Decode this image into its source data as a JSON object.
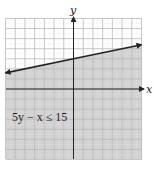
{
  "chart_data": {
    "type": "line",
    "title": "",
    "xlabel": "x",
    "ylabel": "y",
    "xlim": [
      -7,
      7
    ],
    "ylim": [
      -7,
      7
    ],
    "grid": true,
    "grid_step": 1,
    "boundary": {
      "equation": "5y - x = 15",
      "slope": 0.2,
      "intercept": 3,
      "style": "solid",
      "arrows": "both",
      "points": [
        [
          -7,
          1.6
        ],
        [
          7,
          4.4
        ]
      ]
    },
    "shaded_region": "below",
    "annotations": [
      {
        "text": "5y − x ≤ 15",
        "x": -6.4,
        "y": -3.2
      }
    ],
    "colors": {
      "shade": "#d3d3d3",
      "grid_major_unshaded": "#cfcfcf",
      "grid_major_shaded": "#ababab",
      "axis": "#222222",
      "line": "#222222"
    }
  },
  "labels": {
    "x_axis": "x",
    "y_axis": "y",
    "inequality": "5y − x ≤ 15"
  }
}
